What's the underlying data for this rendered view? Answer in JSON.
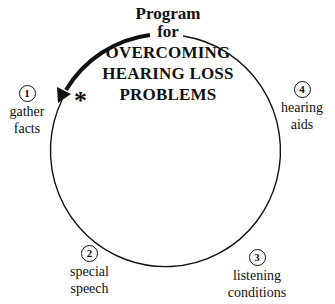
{
  "title": {
    "line1": "Program",
    "line2": "for",
    "line3": "OVERCOMING",
    "line4": "HEARING LOSS",
    "line5": "PROBLEMS"
  },
  "steps": [
    {
      "number": "1",
      "line1": "gather",
      "line2": "facts"
    },
    {
      "number": "2",
      "line1": "special",
      "line2": "speech"
    },
    {
      "number": "3",
      "line1": "listening",
      "line2": "conditions"
    },
    {
      "number": "4",
      "line1": "hearing",
      "line2": "aids"
    }
  ],
  "marker": "*",
  "colors": {
    "ink": "#111111",
    "background": "#ffffff"
  }
}
